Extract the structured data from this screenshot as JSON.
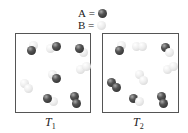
{
  "legend": [
    {
      "symbol": "A",
      "eq": "=",
      "color": "dark"
    },
    {
      "symbol": "B",
      "eq": "=",
      "color": "light"
    }
  ],
  "boxes": [
    {
      "label": "T",
      "subscript": "1",
      "molecules": [
        {
          "type": "AB"
        },
        {
          "type": "AB"
        },
        {
          "type": "AB"
        },
        {
          "type": "BB"
        },
        {
          "type": "AB"
        },
        {
          "type": "BB"
        },
        {
          "type": "AB"
        },
        {
          "type": "AA"
        }
      ]
    },
    {
      "label": "T",
      "subscript": "2",
      "molecules": [
        {
          "type": "AB"
        },
        {
          "type": "BB"
        },
        {
          "type": "AB"
        },
        {
          "type": "BB"
        },
        {
          "type": "BB"
        },
        {
          "type": "AA"
        },
        {
          "type": "AB"
        },
        {
          "type": "AA"
        }
      ]
    }
  ]
}
